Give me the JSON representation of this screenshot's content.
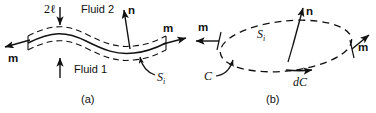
{
  "figure": {
    "panels": [
      {
        "id": "a",
        "caption": "(a)",
        "labels": {
          "thickness": "2ℓ",
          "fluid_upper": "Fluid 2",
          "fluid_lower": "Fluid 1",
          "normal": "n",
          "tangent_left": "m",
          "tangent_right": "m",
          "surface_symbol": "S",
          "surface_subscript": "i"
        }
      },
      {
        "id": "b",
        "caption": "(b)",
        "labels": {
          "normal": "n",
          "conormal_left": "m",
          "conormal_right": "m",
          "surface_symbol": "S",
          "surface_subscript": "i",
          "contour": "C",
          "contour_element": "dC"
        }
      }
    ],
    "colors": {
      "stroke": "#111111",
      "background": "#ffffff"
    }
  }
}
